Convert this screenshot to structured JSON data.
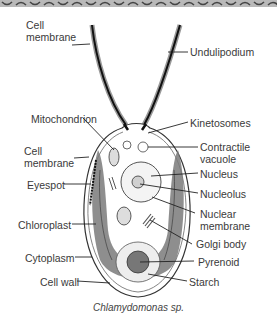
{
  "diagram": {
    "caption_italic": "Chlamydomonas",
    "caption_rest": " sp.",
    "labels_left": [
      {
        "id": "cell-membrane-top",
        "text": "Cell\nmembrane",
        "line1": "Cell",
        "line2": "membrane"
      },
      {
        "id": "mitochondrion",
        "text": "Mitochondrion"
      },
      {
        "id": "cell-membrane-mid",
        "line1": "Cell",
        "line2": "membrane"
      },
      {
        "id": "eyespot",
        "text": "Eyespot"
      },
      {
        "id": "chloroplast",
        "text": "Chloroplast"
      },
      {
        "id": "cytoplasm",
        "text": "Cytoplasm"
      },
      {
        "id": "cell-wall",
        "text": "Cell wall"
      }
    ],
    "labels_right": [
      {
        "id": "undulipodium",
        "text": "Undulipodium"
      },
      {
        "id": "kinetosomes",
        "text": "Kinetosomes"
      },
      {
        "id": "contractile-vacuole",
        "line1": "Contractile",
        "line2": "vacuole"
      },
      {
        "id": "nucleus",
        "text": "Nucleus"
      },
      {
        "id": "nucleolus",
        "text": "Nucleolus"
      },
      {
        "id": "nuclear-membrane",
        "line1": "Nuclear",
        "line2": "membrane"
      },
      {
        "id": "golgi-body",
        "text": "Golgi body"
      },
      {
        "id": "pyrenoid",
        "text": "Pyrenoid"
      },
      {
        "id": "starch",
        "text": "Starch"
      }
    ]
  }
}
